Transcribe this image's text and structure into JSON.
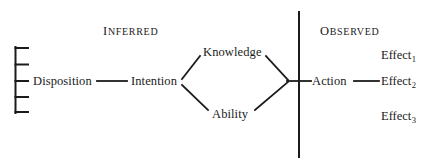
{
  "figure": {
    "headers": {
      "inferred": {
        "first": "I",
        "rest": "NFERRED",
        "full": "INFERRED"
      },
      "observed": {
        "first": "O",
        "rest": "BSERVED",
        "full": "OBSERVED"
      }
    },
    "nodes": {
      "disposition": "Disposition",
      "intention": "Intention",
      "knowledge": "Knowledge",
      "ability": "Ability",
      "action": "Action"
    },
    "effects": [
      {
        "label": "Effect",
        "subscript": "1"
      },
      {
        "label": "Effect",
        "subscript": "2"
      },
      {
        "label": "Effect",
        "subscript": "3"
      }
    ],
    "colors": {
      "ink": "#1b1b1b",
      "background": "#ffffff"
    }
  }
}
